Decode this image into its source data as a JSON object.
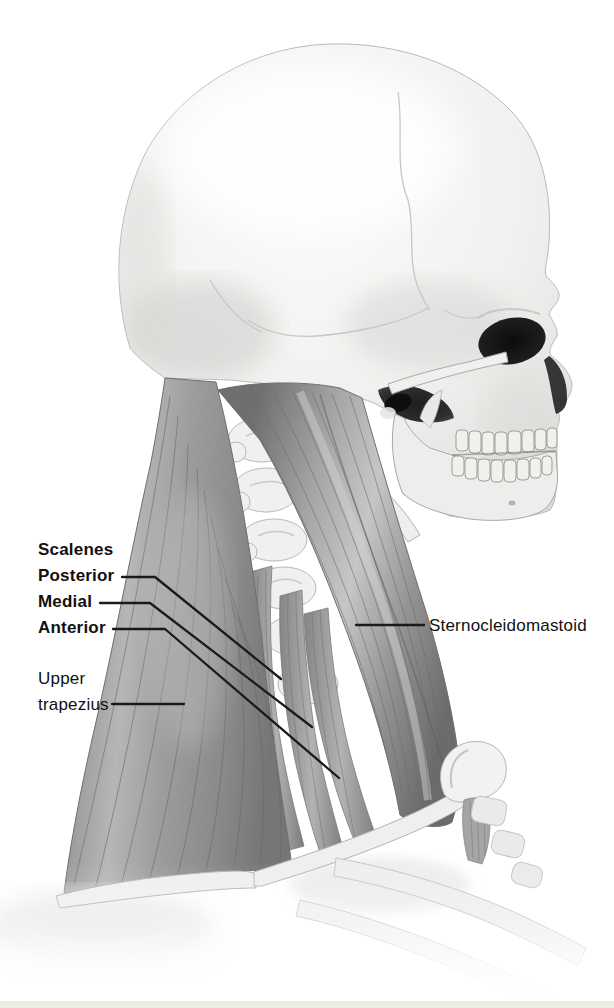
{
  "figure": {
    "labels": {
      "scalenes_heading": "Scalenes",
      "posterior": "Posterior",
      "medial": "Medial",
      "anterior": "Anterior",
      "upper_trapezius": "Upper trapezius",
      "sternocleidomastoid": "Sternocleidomastoid"
    },
    "colors": {
      "muscle": "#9c9c9c",
      "muscle_highlight": "#c6c6c6",
      "muscle_shadow": "#6f6f6f",
      "bone": "#f2f2f0",
      "bone_shadow": "#d6d6d4",
      "cavity": "#161616",
      "label_text": "#111111",
      "leader_line": "#1a1a1a",
      "bottom_strip": "#ecebe6"
    }
  }
}
